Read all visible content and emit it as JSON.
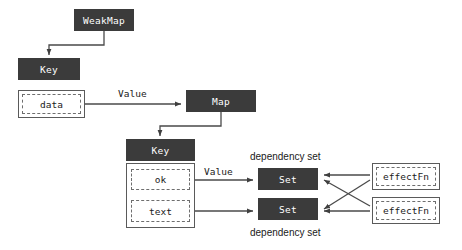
{
  "diagram": {
    "colors": {
      "node_fill": "#3b3b3b",
      "node_text": "#ffffff",
      "outline": "#5a5a5a",
      "dashed": "#6e6e6e",
      "edge": "#4a4a4a",
      "background": "#ffffff"
    },
    "nodes": {
      "weakmap": {
        "label": "WeakMap",
        "x": 74,
        "y": 9,
        "w": 60,
        "h": 22
      },
      "key_top": {
        "label": "Key",
        "x": 18,
        "y": 58,
        "w": 62,
        "h": 22
      },
      "data_container": {
        "x": 18,
        "y": 90,
        "w": 67,
        "h": 28
      },
      "data_inner": {
        "label": "data",
        "x": 22,
        "y": 94,
        "w": 59,
        "h": 20
      },
      "map": {
        "label": "Map",
        "x": 186,
        "y": 90,
        "w": 70,
        "h": 22
      },
      "key_mid": {
        "label": "Key",
        "x": 126,
        "y": 139,
        "w": 69,
        "h": 22
      },
      "props_container": {
        "x": 126,
        "y": 163,
        "w": 69,
        "h": 65
      },
      "ok_inner": {
        "label": "ok",
        "x": 131,
        "y": 169,
        "w": 59,
        "h": 21
      },
      "text_inner": {
        "label": "text",
        "x": 131,
        "y": 200,
        "w": 59,
        "h": 22
      },
      "set_top": {
        "label": "Set",
        "x": 258,
        "y": 168,
        "w": 60,
        "h": 22
      },
      "set_bottom": {
        "label": "Set",
        "x": 258,
        "y": 198,
        "w": 60,
        "h": 22
      },
      "effect_top_container": {
        "x": 372,
        "y": 163,
        "w": 68,
        "h": 27
      },
      "effect_top_inner": {
        "label": "effectFn",
        "x": 376,
        "y": 167,
        "w": 60,
        "h": 19
      },
      "effect_bottom_container": {
        "x": 372,
        "y": 197,
        "w": 68,
        "h": 27
      },
      "effect_bottom_inner": {
        "label": "effectFn",
        "x": 376,
        "y": 201,
        "w": 60,
        "h": 19
      }
    },
    "edge_labels": [
      {
        "text": "Value",
        "x": 118,
        "y": 88
      },
      {
        "text": "Value",
        "x": 204,
        "y": 166
      }
    ],
    "group_labels": [
      {
        "text": "dependency set",
        "x": 250,
        "y": 152
      },
      {
        "text": "dependency set",
        "x": 250,
        "y": 228
      }
    ],
    "edges": [
      {
        "from": "weakmap",
        "to": "key_top",
        "label": ""
      },
      {
        "from": "data_container",
        "to": "map",
        "label": "Value"
      },
      {
        "from": "map",
        "to": "key_mid",
        "label": ""
      },
      {
        "from": "ok_inner",
        "to": "set_top",
        "label": "Value"
      },
      {
        "from": "text_inner",
        "to": "set_bottom",
        "label": ""
      },
      {
        "from": "effect_top_container",
        "to": "set_top",
        "label": ""
      },
      {
        "from": "effect_top_container",
        "to": "set_bottom",
        "label": ""
      },
      {
        "from": "effect_bottom_container",
        "to": "set_top",
        "label": ""
      },
      {
        "from": "effect_bottom_container",
        "to": "set_bottom",
        "label": ""
      }
    ]
  }
}
